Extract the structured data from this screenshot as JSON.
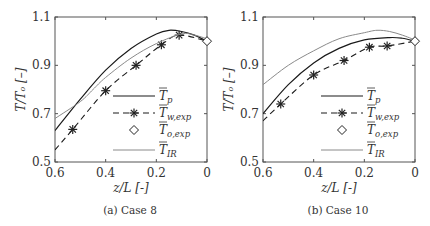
{
  "chart_data": [
    {
      "type": "line",
      "title": "",
      "caption": "(a) Case 8",
      "xlabel": "z/L [-]",
      "ylabel": "T/T_o [-]",
      "xlim": [
        0.6,
        0
      ],
      "ylim": [
        0.5,
        1.1
      ],
      "xticks": [
        "0.6",
        "0.4",
        "0.2",
        "0"
      ],
      "yticks": [
        "0.5",
        "0.7",
        "0.9",
        "1.1"
      ],
      "legend": [
        "T̄_p",
        "T̄_w,exp",
        "T̄_o,exp",
        "T̄_IR"
      ],
      "series": [
        {
          "name": "T_p",
          "style": "solid-dark",
          "x": [
            0.6,
            0.5,
            0.4,
            0.3,
            0.2,
            0.15,
            0.1,
            0.05,
            0.0
          ],
          "y": [
            0.63,
            0.76,
            0.88,
            0.97,
            1.03,
            1.045,
            1.04,
            1.025,
            1.0
          ]
        },
        {
          "name": "T_w,exp",
          "style": "dashed-markers",
          "x": [
            0.6,
            0.53,
            0.4,
            0.28,
            0.18,
            0.11,
            0.0
          ],
          "y": [
            0.55,
            0.635,
            0.795,
            0.9,
            0.985,
            1.025,
            1.0
          ]
        },
        {
          "name": "T_o,exp",
          "style": "diamond",
          "x": [
            0.0
          ],
          "y": [
            1.0
          ]
        },
        {
          "name": "T_IR",
          "style": "solid-gray",
          "x": [
            0.6,
            0.5,
            0.45,
            0.4,
            0.3,
            0.2,
            0.1,
            0.05,
            0.0
          ],
          "y": [
            0.68,
            0.75,
            0.8,
            0.85,
            0.93,
            0.99,
            1.03,
            1.025,
            1.01
          ]
        }
      ]
    },
    {
      "type": "line",
      "title": "",
      "caption": "(b) Case 10",
      "xlabel": "z/L [-]",
      "ylabel": "T/T_o [-]",
      "xlim": [
        0.6,
        0
      ],
      "ylim": [
        0.5,
        1.1
      ],
      "xticks": [
        "0.6",
        "0.4",
        "0.2",
        "0"
      ],
      "yticks": [
        "0.5",
        "0.7",
        "0.9",
        "1.1"
      ],
      "legend": [
        "T̄_p",
        "T̄_w,exp",
        "T̄_o,exp",
        "T̄_IR"
      ],
      "series": [
        {
          "name": "T_p",
          "style": "solid-dark",
          "x": [
            0.6,
            0.5,
            0.4,
            0.3,
            0.2,
            0.1,
            0.05,
            0.0
          ],
          "y": [
            0.7,
            0.82,
            0.91,
            0.97,
            1.005,
            1.015,
            1.012,
            1.0
          ]
        },
        {
          "name": "T_w,exp",
          "style": "dashed-markers",
          "x": [
            0.6,
            0.53,
            0.4,
            0.28,
            0.18,
            0.11,
            0.0
          ],
          "y": [
            0.67,
            0.74,
            0.86,
            0.92,
            0.975,
            0.98,
            1.0
          ]
        },
        {
          "name": "T_o,exp",
          "style": "diamond",
          "x": [
            0.0
          ],
          "y": [
            1.0
          ]
        },
        {
          "name": "T_IR",
          "style": "solid-gray",
          "x": [
            0.6,
            0.5,
            0.4,
            0.3,
            0.2,
            0.15,
            0.1,
            0.05,
            0.0
          ],
          "y": [
            0.82,
            0.9,
            0.96,
            1.01,
            1.035,
            1.045,
            1.04,
            1.025,
            1.005
          ]
        }
      ]
    }
  ],
  "panels": [
    {
      "caption": "(a) Case 8",
      "xlabel": "z/L [-]",
      "ylabel": "T/Tₒ [–]"
    },
    {
      "caption": "(b) Case 10",
      "xlabel": "z/L [-]",
      "ylabel": "T/Tₒ [–]"
    }
  ],
  "ticks": {
    "x": [
      "0.6",
      "0.4",
      "0.2",
      "0"
    ],
    "y": [
      "1.1",
      "0.9",
      "0.7",
      "0.5"
    ]
  },
  "legend": [
    {
      "main": "T",
      "sub": "p"
    },
    {
      "main": "T",
      "sub": "w,exp"
    },
    {
      "main": "T",
      "sub": "o,exp"
    },
    {
      "main": "T",
      "sub": "IR"
    }
  ]
}
